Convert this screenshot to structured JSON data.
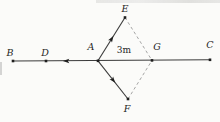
{
  "figure": {
    "colors": {
      "background": "#fbfbf9",
      "solid_line": "#3b3b3b",
      "dashed_line": "#8f8f8f",
      "marker": "#1e1e1e",
      "label": "#1f1f1f"
    },
    "unit_label": {
      "text": "3m",
      "x": 124,
      "y": 52.5
    },
    "points": [
      {
        "id": "B",
        "label": "B",
        "x": 13,
        "y": 61,
        "lx": 10,
        "ly": 56
      },
      {
        "id": "D",
        "label": "D",
        "x": 46,
        "y": 61,
        "lx": 45,
        "ly": 56
      },
      {
        "id": "A",
        "label": "A",
        "x": 98,
        "y": 60.8,
        "lx": 91,
        "ly": 50
      },
      {
        "id": "G",
        "label": "G",
        "x": 152,
        "y": 60.4,
        "lx": 157,
        "ly": 50
      },
      {
        "id": "C",
        "label": "C",
        "x": 210,
        "y": 59.8,
        "lx": 210,
        "ly": 48
      },
      {
        "id": "E",
        "label": "E",
        "x": 125,
        "y": 17.5,
        "lx": 125,
        "ly": 11.5
      },
      {
        "id": "F",
        "label": "F",
        "x": 128,
        "y": 99,
        "lx": 127,
        "ly": 112
      }
    ],
    "segments": [
      {
        "from": "B",
        "to": "C",
        "style": "solid"
      },
      {
        "from": "A",
        "to": "E",
        "style": "solid"
      },
      {
        "from": "A",
        "to": "F",
        "style": "solid"
      },
      {
        "from": "E",
        "to": "G",
        "style": "dashed"
      },
      {
        "from": "F",
        "to": "G",
        "style": "dashed"
      }
    ],
    "arrows": [
      {
        "on": "DA",
        "x": 66.5,
        "y": 61,
        "angle": 180
      },
      {
        "on": "AE",
        "x": 111.5,
        "y": 39,
        "angle": -58.5
      },
      {
        "on": "AF",
        "x": 113,
        "y": 80,
        "angle": 51.7
      }
    ]
  }
}
